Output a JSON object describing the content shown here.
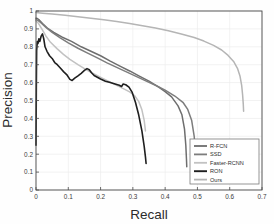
{
  "chart_data": {
    "type": "line",
    "title": "",
    "xlabel": "Recall",
    "ylabel": "Precision",
    "xlim": [
      0,
      0.7
    ],
    "ylim": [
      0,
      1
    ],
    "xticks": [
      "0",
      "0.1",
      "0.2",
      "0.3",
      "0.4",
      "0.5",
      "0.6",
      "0.7"
    ],
    "xtick_values": [
      0,
      0.1,
      0.2,
      0.3,
      0.4,
      0.5,
      0.6,
      0.7
    ],
    "yticks": [
      "0",
      "0.1",
      "0.2",
      "0.3",
      "0.4",
      "0.5",
      "0.6",
      "0.7",
      "0.8",
      "0.9",
      "1"
    ],
    "ytick_values": [
      0,
      0.1,
      0.2,
      0.3,
      0.4,
      0.5,
      0.6,
      0.7,
      0.8,
      0.9,
      1
    ],
    "grid": true,
    "legend_position": "lower-right",
    "series": [
      {
        "name": "R-FCN",
        "color": "#6e6e6e",
        "width": 1.5,
        "points": [
          [
            0.0,
            0.96
          ],
          [
            0.004,
            0.958
          ],
          [
            0.01,
            0.95
          ],
          [
            0.02,
            0.93
          ],
          [
            0.035,
            0.905
          ],
          [
            0.055,
            0.88
          ],
          [
            0.08,
            0.855
          ],
          [
            0.11,
            0.83
          ],
          [
            0.14,
            0.8
          ],
          [
            0.17,
            0.775
          ],
          [
            0.2,
            0.75
          ],
          [
            0.23,
            0.72
          ],
          [
            0.26,
            0.692
          ],
          [
            0.29,
            0.665
          ],
          [
            0.32,
            0.636
          ],
          [
            0.35,
            0.608
          ],
          [
            0.38,
            0.575
          ],
          [
            0.4,
            0.55
          ],
          [
            0.42,
            0.52
          ],
          [
            0.44,
            0.47
          ],
          [
            0.452,
            0.42
          ],
          [
            0.46,
            0.34
          ],
          [
            0.464,
            0.25
          ],
          [
            0.466,
            0.175
          ],
          [
            0.467,
            0.13
          ]
        ]
      },
      {
        "name": "SSD",
        "color": "#7d7d7d",
        "width": 1.5,
        "points": [
          [
            0.0,
            0.95
          ],
          [
            0.006,
            0.948
          ],
          [
            0.015,
            0.935
          ],
          [
            0.03,
            0.91
          ],
          [
            0.05,
            0.88
          ],
          [
            0.075,
            0.85
          ],
          [
            0.1,
            0.822
          ],
          [
            0.13,
            0.792
          ],
          [
            0.16,
            0.765
          ],
          [
            0.19,
            0.738
          ],
          [
            0.22,
            0.71
          ],
          [
            0.25,
            0.685
          ],
          [
            0.28,
            0.66
          ],
          [
            0.31,
            0.635
          ],
          [
            0.34,
            0.61
          ],
          [
            0.37,
            0.585
          ],
          [
            0.4,
            0.558
          ],
          [
            0.43,
            0.525
          ],
          [
            0.455,
            0.49
          ],
          [
            0.47,
            0.45
          ],
          [
            0.482,
            0.39
          ],
          [
            0.49,
            0.3
          ],
          [
            0.494,
            0.2
          ],
          [
            0.496,
            0.13
          ],
          [
            0.497,
            0.08
          ]
        ]
      },
      {
        "name": "Faster-RCNN",
        "color": "#c2c2c2",
        "width": 1.5,
        "points": [
          [
            0.0,
            0.945
          ],
          [
            0.008,
            0.93
          ],
          [
            0.018,
            0.9
          ],
          [
            0.03,
            0.862
          ],
          [
            0.045,
            0.825
          ],
          [
            0.065,
            0.79
          ],
          [
            0.085,
            0.758
          ],
          [
            0.105,
            0.73
          ],
          [
            0.13,
            0.7
          ],
          [
            0.155,
            0.672
          ],
          [
            0.18,
            0.648
          ],
          [
            0.205,
            0.625
          ],
          [
            0.23,
            0.602
          ],
          [
            0.255,
            0.58
          ],
          [
            0.275,
            0.562
          ],
          [
            0.29,
            0.548
          ],
          [
            0.305,
            0.528
          ],
          [
            0.318,
            0.495
          ],
          [
            0.328,
            0.448
          ],
          [
            0.335,
            0.39
          ],
          [
            0.339,
            0.33
          ]
        ]
      },
      {
        "name": "RON",
        "color": "#1f1f1f",
        "width": 1.6,
        "points": [
          [
            0.0,
            0.25
          ],
          [
            0.001,
            0.56
          ],
          [
            0.002,
            0.78
          ],
          [
            0.004,
            0.83
          ],
          [
            0.006,
            0.818
          ],
          [
            0.009,
            0.845
          ],
          [
            0.012,
            0.83
          ],
          [
            0.016,
            0.86
          ],
          [
            0.02,
            0.872
          ],
          [
            0.024,
            0.845
          ],
          [
            0.028,
            0.8
          ],
          [
            0.034,
            0.775
          ],
          [
            0.042,
            0.75
          ],
          [
            0.05,
            0.735
          ],
          [
            0.058,
            0.712
          ],
          [
            0.066,
            0.7
          ],
          [
            0.076,
            0.68
          ],
          [
            0.086,
            0.66
          ],
          [
            0.095,
            0.645
          ],
          [
            0.105,
            0.618
          ],
          [
            0.112,
            0.612
          ],
          [
            0.12,
            0.625
          ],
          [
            0.13,
            0.638
          ],
          [
            0.14,
            0.652
          ],
          [
            0.15,
            0.668
          ],
          [
            0.158,
            0.678
          ],
          [
            0.165,
            0.672
          ],
          [
            0.172,
            0.655
          ],
          [
            0.18,
            0.64
          ],
          [
            0.19,
            0.63
          ],
          [
            0.2,
            0.62
          ],
          [
            0.215,
            0.608
          ],
          [
            0.23,
            0.6
          ],
          [
            0.245,
            0.592
          ],
          [
            0.258,
            0.585
          ],
          [
            0.265,
            0.578
          ],
          [
            0.27,
            0.592
          ],
          [
            0.278,
            0.588
          ],
          [
            0.288,
            0.575
          ],
          [
            0.298,
            0.545
          ],
          [
            0.308,
            0.49
          ],
          [
            0.318,
            0.42
          ],
          [
            0.328,
            0.33
          ],
          [
            0.335,
            0.245
          ],
          [
            0.339,
            0.185
          ],
          [
            0.341,
            0.148
          ]
        ]
      },
      {
        "name": "Ours",
        "color": "#b5b5b5",
        "width": 1.5,
        "points": [
          [
            0.0,
            0.992
          ],
          [
            0.02,
            0.988
          ],
          [
            0.05,
            0.983
          ],
          [
            0.09,
            0.976
          ],
          [
            0.13,
            0.968
          ],
          [
            0.17,
            0.96
          ],
          [
            0.21,
            0.951
          ],
          [
            0.25,
            0.941
          ],
          [
            0.29,
            0.93
          ],
          [
            0.33,
            0.918
          ],
          [
            0.37,
            0.905
          ],
          [
            0.41,
            0.89
          ],
          [
            0.45,
            0.872
          ],
          [
            0.49,
            0.852
          ],
          [
            0.52,
            0.832
          ],
          [
            0.55,
            0.808
          ],
          [
            0.575,
            0.782
          ],
          [
            0.595,
            0.752
          ],
          [
            0.612,
            0.718
          ],
          [
            0.624,
            0.68
          ],
          [
            0.632,
            0.635
          ],
          [
            0.637,
            0.585
          ],
          [
            0.64,
            0.53
          ],
          [
            0.642,
            0.48
          ],
          [
            0.643,
            0.44
          ]
        ]
      }
    ]
  },
  "legend": {
    "items": [
      {
        "label": "R-FCN"
      },
      {
        "label": "SSD"
      },
      {
        "label": "Faster-RCNN"
      },
      {
        "label": "RON"
      },
      {
        "label": "Ours"
      }
    ]
  },
  "axes": {
    "grid_color": "#ececec",
    "axis_color": "#4a4a4a"
  }
}
